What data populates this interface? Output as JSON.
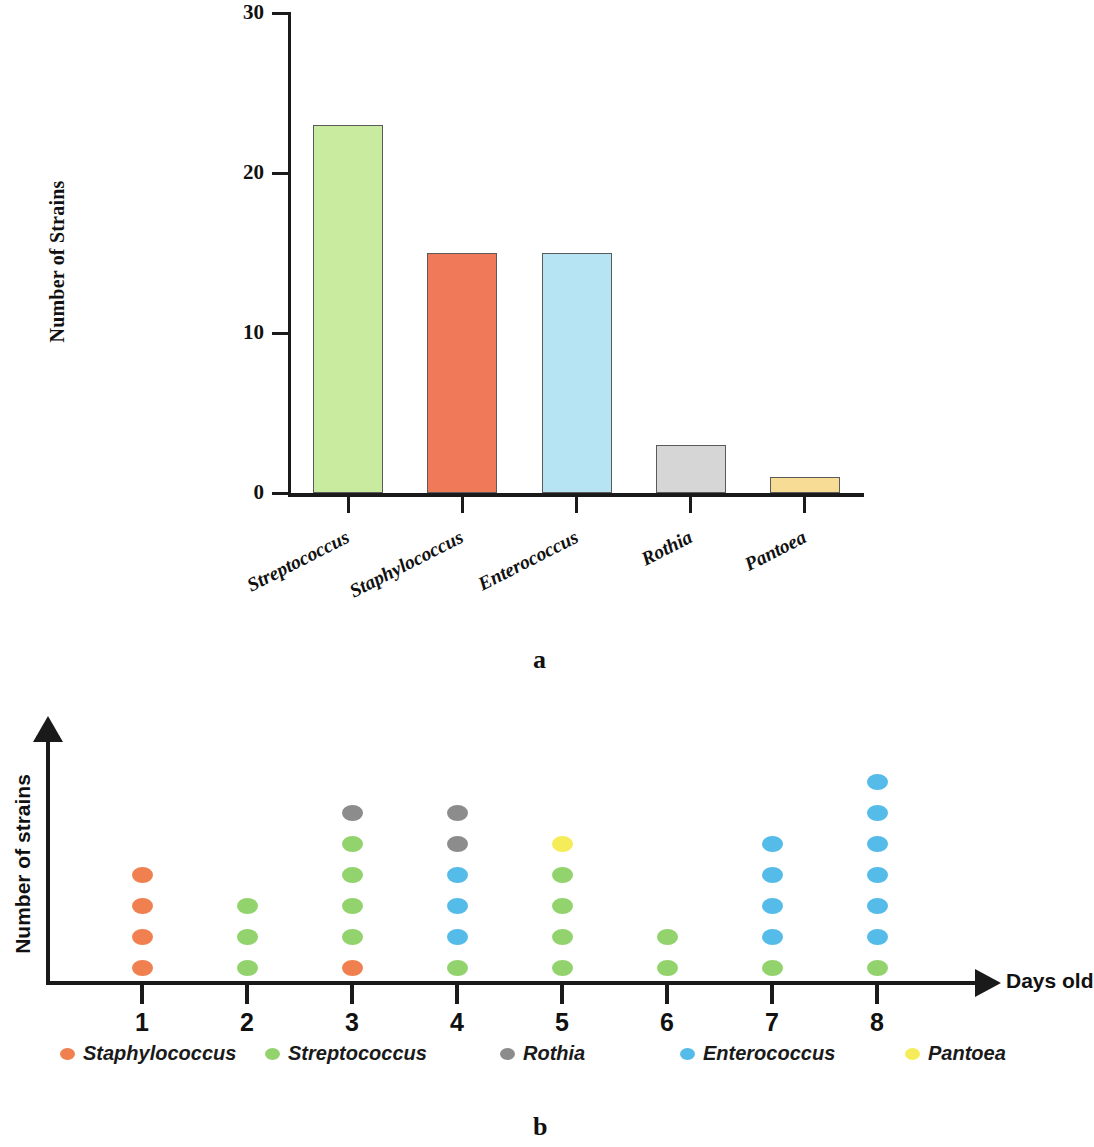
{
  "figure": {
    "panel_a_letter": "a",
    "panel_b_letter": "b"
  },
  "chart_data": [
    {
      "type": "bar",
      "panel": "a",
      "title": "",
      "xlabel": "",
      "ylabel": "Number of Strains",
      "ylim": [
        0,
        30
      ],
      "yticks": [
        0,
        10,
        20,
        30
      ],
      "ytick_labels": [
        "0",
        "10",
        "20",
        "30"
      ],
      "grid": false,
      "legend": "none",
      "categories": [
        "Streptococcus",
        "Staphylococcus",
        "Enterococcus",
        "Rothia",
        "Pantoea"
      ],
      "values": [
        23,
        15,
        15,
        3,
        1
      ],
      "bar_colors": [
        "#c9eba0",
        "#f0795a",
        "#b6e4f2",
        "#d6d6d6",
        "#f6dc95"
      ],
      "bar_border_color": "#5a5a5a"
    },
    {
      "type": "scatter",
      "panel": "b",
      "title": "",
      "xlabel": "Days old",
      "ylabel": "Number of strains",
      "grid": false,
      "legend_position": "bottom",
      "x": [
        1,
        2,
        3,
        4,
        5,
        6,
        7,
        8
      ],
      "xtick_labels": [
        "1",
        "2",
        "3",
        "4",
        "5",
        "6",
        "7",
        "8"
      ],
      "legend_entries": [
        {
          "name": "Staphylococcus",
          "color": "#f08050"
        },
        {
          "name": "Streptococcus",
          "color": "#92d36e"
        },
        {
          "name": "Rothia",
          "color": "#8c8c8c"
        },
        {
          "name": "Enterococcus",
          "color": "#55bbe8"
        },
        {
          "name": "Pantoea",
          "color": "#f5ec5a"
        }
      ],
      "columns": [
        {
          "day": 1,
          "count": 4,
          "stack": [
            "Staphylococcus",
            "Staphylococcus",
            "Staphylococcus",
            "Staphylococcus"
          ]
        },
        {
          "day": 2,
          "count": 3,
          "stack": [
            "Streptococcus",
            "Streptococcus",
            "Streptococcus"
          ]
        },
        {
          "day": 3,
          "count": 6,
          "stack": [
            "Staphylococcus",
            "Streptococcus",
            "Streptococcus",
            "Streptococcus",
            "Streptococcus",
            "Rothia"
          ]
        },
        {
          "day": 4,
          "count": 6,
          "stack": [
            "Streptococcus",
            "Enterococcus",
            "Enterococcus",
            "Enterococcus",
            "Rothia",
            "Rothia"
          ]
        },
        {
          "day": 5,
          "count": 5,
          "stack": [
            "Streptococcus",
            "Streptococcus",
            "Streptococcus",
            "Streptococcus",
            "Pantoea"
          ]
        },
        {
          "day": 6,
          "count": 2,
          "stack": [
            "Streptococcus",
            "Streptococcus"
          ]
        },
        {
          "day": 7,
          "count": 5,
          "stack": [
            "Streptococcus",
            "Enterococcus",
            "Enterococcus",
            "Enterococcus",
            "Enterococcus"
          ]
        },
        {
          "day": 8,
          "count": 7,
          "stack": [
            "Streptococcus",
            "Enterococcus",
            "Enterococcus",
            "Enterococcus",
            "Enterococcus",
            "Enterococcus",
            "Enterococcus"
          ]
        }
      ]
    }
  ]
}
